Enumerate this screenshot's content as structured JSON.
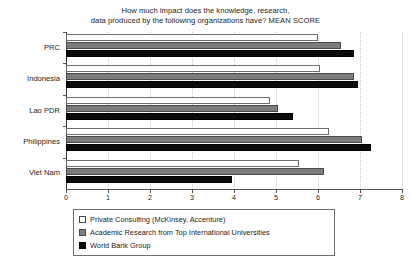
{
  "chart_data": {
    "type": "bar",
    "orientation": "horizontal",
    "title": "How much impact does the knowledge, research, data produced by the following organizations have? MEAN SCORE",
    "title_lines": [
      "How much impact does the knowledge, research,",
      "data produced by the following organizations have? MEAN SCORE"
    ],
    "xlabel": "",
    "ylabel": "",
    "xlim": [
      0,
      8
    ],
    "xticks": [
      0,
      1,
      2,
      3,
      4,
      5,
      6,
      7,
      8
    ],
    "xtick_labels": [
      "0",
      "1",
      "2",
      "3",
      "4",
      "5",
      "6",
      "7",
      "8"
    ],
    "grid": "vertical-dotted",
    "legend_position": "bottom",
    "categories": [
      "PRC",
      "Indonesia",
      "Lao PDR",
      "Philippines",
      "Viet Nam"
    ],
    "series": [
      {
        "name": "Private Consulting (McKinsey, Accenture)",
        "color": "#ffffff",
        "values": [
          6.0,
          6.05,
          4.85,
          6.25,
          5.55
        ]
      },
      {
        "name": "Academic Research from Top International Universities",
        "color": "#7c7c7c",
        "values": [
          6.55,
          6.85,
          5.05,
          7.05,
          6.15
        ]
      },
      {
        "name": "World Bank Group",
        "color": "#0a0a0a",
        "values": [
          6.85,
          6.95,
          5.4,
          7.25,
          3.95
        ]
      }
    ]
  },
  "legend": {
    "items": [
      {
        "label": "Private Consulting (McKinsey, Accenture)",
        "swatch": "series-white"
      },
      {
        "label": "Academic Research from Top International Universities",
        "swatch": "series-gray"
      },
      {
        "label": "World Bank Group",
        "swatch": "series-black"
      }
    ]
  }
}
